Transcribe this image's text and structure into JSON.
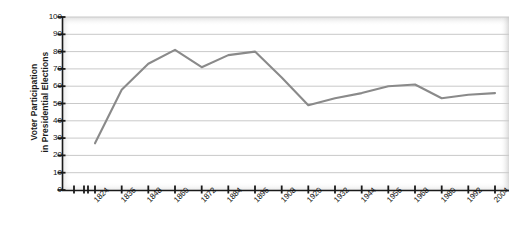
{
  "chart_data": {
    "type": "line",
    "title": "",
    "xlabel": "Year",
    "ylabel_lines": [
      "Voter Participation",
      "in Presidential Elections"
    ],
    "ylabel": "Voter Participation in Presidential Elections",
    "categories": [
      "1824",
      "1836",
      "1848",
      "1860",
      "1872",
      "1884",
      "1896",
      "1908",
      "1920",
      "1932",
      "1944",
      "1956",
      "1968",
      "1980",
      "1992",
      "2004"
    ],
    "x_tick_labels": [
      "1824",
      "1836",
      "1848",
      "1860",
      "1872",
      "1884",
      "1896",
      "1908",
      "1920",
      "1932",
      "1944",
      "1956",
      "1968",
      "1980",
      "1992",
      "2004"
    ],
    "y_tick_labels": [
      "0",
      "10",
      "20",
      "30",
      "40",
      "50",
      "60",
      "70",
      "80",
      "90",
      "100"
    ],
    "y_ticks": [
      0,
      10,
      20,
      30,
      40,
      50,
      60,
      70,
      80,
      90,
      100
    ],
    "ylim": [
      0,
      100
    ],
    "grid": true,
    "legend": "none",
    "series": [
      {
        "name": "Voter Participation",
        "values": [
          27,
          58,
          73,
          81,
          71,
          78,
          80,
          65,
          49,
          53,
          56,
          60,
          61,
          53,
          55,
          56
        ]
      }
    ],
    "line_color": "#8a8a8a",
    "grid_color": "#c9c9c9",
    "axis_color": "#1a1a1a",
    "plot_background": "#ffffff"
  }
}
